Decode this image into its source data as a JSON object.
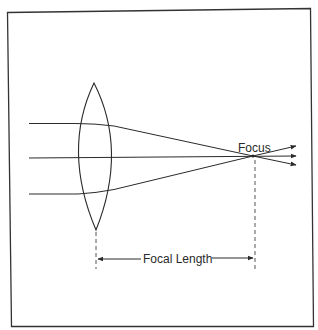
{
  "diagram": {
    "labels": {
      "focus": "Focus",
      "focal_length": "Focal Length"
    },
    "colors": {
      "stroke": "#2a2a2a",
      "frame": "#333333",
      "dashed": "#555555",
      "background": "#ffffff"
    },
    "elements": {
      "lens": "biconvex lens",
      "rays": [
        "top incoming ray",
        "center ray",
        "bottom incoming ray"
      ],
      "focus_point": "focal point where rays converge",
      "dimension": "focal length measured from lens center to focus"
    }
  }
}
